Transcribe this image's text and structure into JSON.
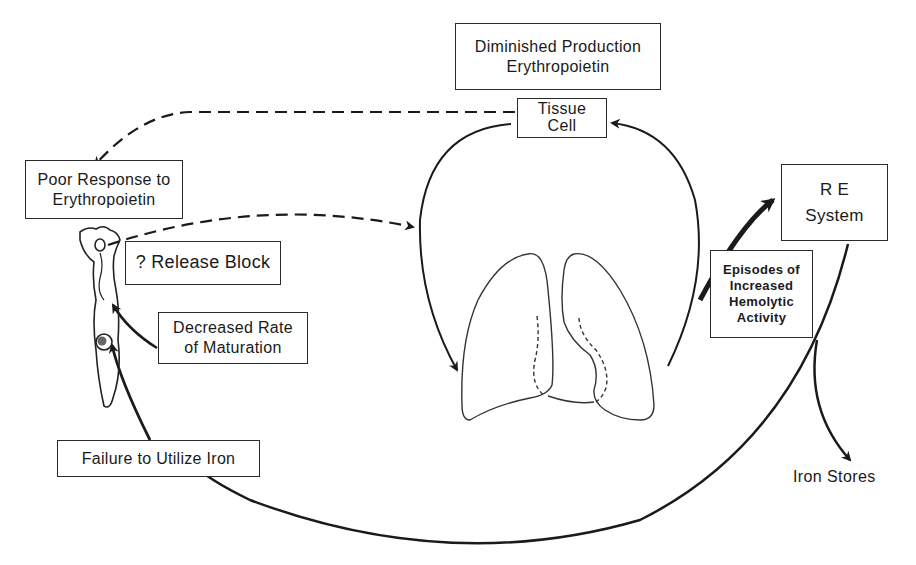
{
  "diagram": {
    "title_box": {
      "lines": [
        "Diminished Production",
        "Erythropoietin"
      ]
    },
    "tissue_cell": {
      "lines": [
        "Tissue",
        "Cell"
      ]
    },
    "poor_response": {
      "lines": [
        "Poor Response to",
        "Erythropoietin"
      ]
    },
    "release_block": {
      "lines": [
        "? Release Block"
      ]
    },
    "decreased_rate": {
      "lines": [
        "Decreased Rate",
        "of Maturation"
      ]
    },
    "failure_iron": {
      "lines": [
        "Failure to Utilize Iron"
      ]
    },
    "re_system": {
      "lines": [
        "R E",
        "System"
      ]
    },
    "hemolytic": {
      "lines": [
        "Episodes of",
        "Increased",
        "Hemolytic",
        "Activity"
      ]
    },
    "iron_stores": {
      "label": "Iron Stores"
    },
    "icons": {
      "lungs": "lungs-illustration",
      "marrow_cell": "erythroid-cell-illustration"
    },
    "colors": {
      "ink": "#1a1a1a",
      "background": "#ffffff"
    }
  }
}
